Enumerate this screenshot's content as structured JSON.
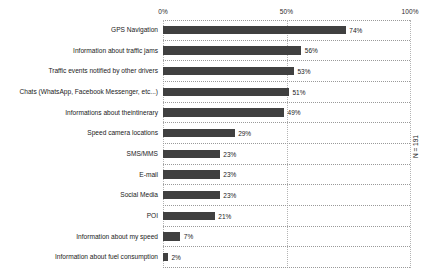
{
  "chart_data": {
    "type": "bar",
    "orientation": "horizontal",
    "title": "",
    "xlabel": "",
    "ylabel": "",
    "xlim": [
      0,
      100
    ],
    "grid": true,
    "legend": null,
    "annotation": "N = 191",
    "tick_labels": [
      "0%",
      "50%",
      "100%"
    ],
    "tick_values": [
      0,
      50,
      100
    ],
    "categories": [
      "GPS Navigation",
      "Information about traffic jams",
      "Traffic events notified by other drivers",
      "Chats (WhatsApp, Facebook Messenger, etc...)",
      "Informations about theintinerary",
      "Speed camera locations",
      "SMS/MMS",
      "E-mail",
      "Social Media",
      "POI",
      "Information about my speed",
      "Information about fuel consumption"
    ],
    "values": [
      74,
      56,
      53,
      51,
      49,
      29,
      23,
      23,
      23,
      21,
      7,
      2
    ],
    "value_labels": [
      "74%",
      "56%",
      "53%",
      "51%",
      "49%",
      "29%",
      "23%",
      "23%",
      "23%",
      "21%",
      "7%",
      "2%"
    ],
    "bar_color": "#404040",
    "gridline_color": "#b4b4b4",
    "background_color": "#ffffff"
  }
}
